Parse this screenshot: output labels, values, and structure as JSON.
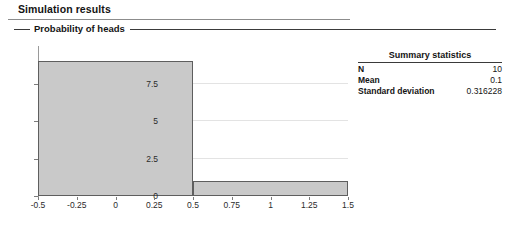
{
  "page": {
    "title": "Simulation results"
  },
  "group": {
    "legend": "Probability of heads"
  },
  "chart_data": {
    "type": "bar",
    "title": "",
    "subtitle": "",
    "xlabel": "",
    "ylabel": "",
    "grid": true,
    "legend_position": "none",
    "xlim": [
      -0.5,
      1.5
    ],
    "ylim": [
      0,
      10
    ],
    "xticks": [
      "-0.5",
      "-0.25",
      "0",
      "0.25",
      "0.5",
      "0.75",
      "1",
      "1.25",
      "1.5"
    ],
    "xtick_values": [
      -0.5,
      -0.25,
      0,
      0.25,
      0.5,
      0.75,
      1,
      1.25,
      1.5
    ],
    "yticks": [
      "0",
      "2.5",
      "5",
      "7.5"
    ],
    "ytick_values": [
      0,
      2.5,
      5,
      7.5
    ],
    "bin_edges": [
      -0.5,
      0.5,
      1.5
    ],
    "categories": [
      "-0.5 to 0.5",
      "0.5 to 1.5"
    ],
    "values": [
      9,
      1
    ],
    "bar_fill_color": "#c9c9c9",
    "bar_border_color": "#5e5e5e",
    "gridline_color": "#e3e3e3"
  },
  "stats": {
    "title": "Summary statistics",
    "rows": [
      {
        "label": "N",
        "value": "10"
      },
      {
        "label": "Mean",
        "value": "0.1"
      },
      {
        "label": "Standard deviation",
        "value": "0.316228"
      }
    ]
  }
}
